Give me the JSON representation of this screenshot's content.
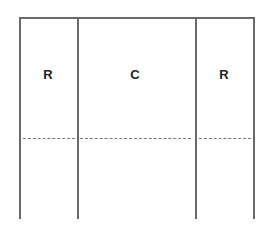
{
  "diagram": {
    "columns": [
      {
        "label": "R",
        "x_start": 19,
        "x_end": 77
      },
      {
        "label": "C",
        "x_start": 77,
        "x_end": 195
      },
      {
        "label": "R",
        "x_start": 195,
        "x_end": 253
      }
    ],
    "colors": {
      "line": "#6a6a6a",
      "dash": "#777777",
      "text": "#222222"
    }
  }
}
